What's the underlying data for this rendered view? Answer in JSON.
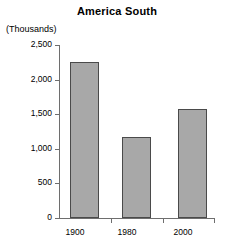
{
  "chart_data": {
    "type": "bar",
    "title": "America South",
    "xlabel": "",
    "ylabel": "(Thousands)",
    "categories": [
      "1900",
      "1980",
      "2000"
    ],
    "values": [
      2250,
      1170,
      1570
    ],
    "series": [
      {
        "name": "America South",
        "values": [
          2250,
          1170,
          1570
        ]
      }
    ],
    "ylim": [
      0,
      2500
    ],
    "yticks": [
      0,
      500,
      1000,
      1500,
      2000,
      2500
    ],
    "ytick_labels": [
      "0",
      "500",
      "1,000",
      "1,500",
      "2,000",
      "2,500"
    ],
    "grid": false,
    "legend": false,
    "legend_position": "none",
    "bar_color": "#a8a8a8",
    "bar_edge_color": "#4a4a4a",
    "axis_color": "#6e6e6e",
    "background_color": "#ffffff"
  }
}
